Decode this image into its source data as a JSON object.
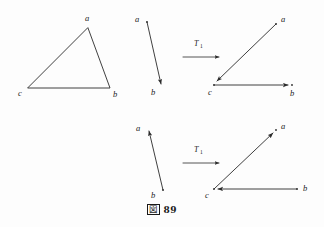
{
  "figure": {
    "caption_glyph": "図",
    "caption_number": "89",
    "caption_full": "図 89"
  },
  "panels": {
    "triangle": {
      "name": "triangle-abc",
      "vertices": [
        {
          "label": "a",
          "x": 88,
          "y": 28,
          "label_x": 85,
          "label_y": 21
        },
        {
          "label": "b",
          "x": 110,
          "y": 88,
          "label_x": 113,
          "label_y": 97
        },
        {
          "label": "c",
          "x": 28,
          "y": 88,
          "label_x": 18,
          "label_y": 96
        }
      ],
      "edges": [
        {
          "from": "a",
          "to": "b"
        },
        {
          "from": "b",
          "to": "c"
        },
        {
          "from": "c",
          "to": "a"
        }
      ]
    },
    "top_source": {
      "name": "top-source-vector",
      "label_a": "a",
      "label_b": "b",
      "from": {
        "x": 147,
        "y": 22
      },
      "to": {
        "x": 163,
        "y": 87
      },
      "label_a_pos": {
        "x": 137,
        "y": 22
      },
      "label_b_pos": {
        "x": 152,
        "y": 94
      },
      "direction": "a-to-b"
    },
    "top_arrow": {
      "name": "transform-arrow-top",
      "label": "T",
      "subscript": "1",
      "from": {
        "x": 183,
        "y": 57
      },
      "to": {
        "x": 222,
        "y": 57
      },
      "label_pos": {
        "x": 196,
        "y": 48
      }
    },
    "top_result": {
      "name": "top-result-figure",
      "vertices": [
        {
          "label": "a",
          "x": 276,
          "y": 24,
          "label_x": 281,
          "label_y": 22
        },
        {
          "label": "b",
          "x": 292,
          "y": 85,
          "label_x": 291,
          "label_y": 95
        },
        {
          "label": "c",
          "x": 214,
          "y": 84,
          "label_x": 208,
          "label_y": 94
        }
      ],
      "vectors": [
        {
          "from": "a",
          "to": "c",
          "arrow_at": "c"
        },
        {
          "from": "c",
          "to": "b",
          "arrow_at": "b"
        }
      ]
    },
    "bottom_source": {
      "name": "bottom-source-vector",
      "label_a": "a",
      "label_b": "b",
      "from": {
        "x": 163,
        "y": 190
      },
      "to": {
        "x": 148,
        "y": 130
      },
      "label_a_pos": {
        "x": 138,
        "y": 130
      },
      "label_b_pos": {
        "x": 152,
        "y": 197
      },
      "direction": "b-to-a"
    },
    "bottom_arrow": {
      "name": "transform-arrow-bottom",
      "label": "T",
      "subscript": "1",
      "from": {
        "x": 183,
        "y": 163
      },
      "to": {
        "x": 222,
        "y": 163
      },
      "label_pos": {
        "x": 196,
        "y": 154
      }
    },
    "bottom_result": {
      "name": "bottom-result-figure",
      "vertices": [
        {
          "label": "a",
          "x": 276,
          "y": 130,
          "label_x": 281,
          "label_y": 129
        },
        {
          "label": "b",
          "x": 297,
          "y": 188,
          "label_x": 303,
          "label_y": 190
        },
        {
          "label": "c",
          "x": 214,
          "y": 190,
          "label_x": 206,
          "label_y": 198
        }
      ],
      "vectors": [
        {
          "from": "c",
          "to": "a",
          "arrow_at": "a"
        },
        {
          "from": "b",
          "to": "c",
          "arrow_at": "c"
        }
      ]
    }
  },
  "labels": {
    "a": "a",
    "b": "b",
    "c": "c",
    "T": "T",
    "one": "1"
  }
}
